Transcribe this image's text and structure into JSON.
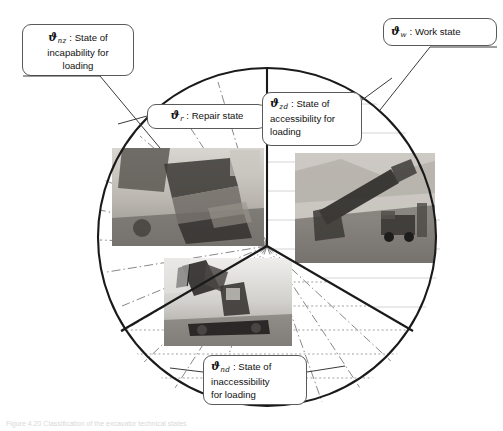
{
  "figure": {
    "title_caption": "Figure 4.20  Classification of the excavator technical states",
    "circle": {
      "cx": 267,
      "cy": 237,
      "r": 170
    },
    "junction": {
      "x": 267,
      "y": 246
    }
  },
  "callouts": {
    "incapability": {
      "symbol": "ϑ",
      "subscript": "nz",
      "separator": " : ",
      "line1": "State of",
      "line2": "incapability for",
      "line3": "loading",
      "text": "ϑnz : State of incapability for loading"
    },
    "work": {
      "symbol": "ϑ",
      "subscript": "w",
      "separator": " : ",
      "line1": "Work state",
      "text": "ϑw : Work state"
    },
    "repair": {
      "symbol": "ϑ",
      "subscript": "r",
      "separator": " : ",
      "line1": "Repair state",
      "text": "ϑr : Repair state"
    },
    "accessibility": {
      "symbol": "ϑ",
      "subscript": "zd",
      "separator": " : ",
      "line1": "State of",
      "line2": "accessibility for",
      "line3": "loading",
      "text": "ϑzd : State of accessibility for loading"
    },
    "inaccessibility": {
      "symbol": "ϑ",
      "subscript": "nd",
      "separator": " : ",
      "line1": "State of",
      "line2": "inaccessibility",
      "line3": "for loading",
      "text": "ϑnd : State of inaccessibility for loading"
    }
  },
  "photos": {
    "repair": {
      "alt": "excavator-bucket-under-repair-photo"
    },
    "work": {
      "alt": "mining-shovel-loading-truck-photo"
    },
    "inaccessible": {
      "alt": "idle-excavator-on-bench-photo"
    }
  },
  "sectors": [
    {
      "name": "repair",
      "label": "Repair state"
    },
    {
      "name": "accessibility",
      "label": "State of accessibility for loading"
    },
    {
      "name": "inaccessibility",
      "label": "State of inaccessibility for loading"
    }
  ],
  "colors": {
    "outline": "#1a1a1a",
    "callout_border": "#5a5a5a",
    "leader": "#3a3a3a",
    "hatch": "#555555",
    "background": "#ffffff",
    "caption": "#d8d8d8"
  }
}
